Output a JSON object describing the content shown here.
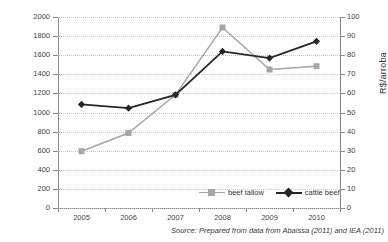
{
  "figure": {
    "title": "",
    "source_note": "Source: Prepared from data from Abaissa (2011) and IEA (2011)"
  },
  "legend": {
    "items": [
      {
        "label": "beef tallow",
        "color": "#a6a6a6",
        "marker": "square"
      },
      {
        "label": "cattle beef",
        "color": "#262626",
        "marker": "diamond"
      }
    ]
  },
  "chart_data": {
    "type": "line",
    "title": "",
    "xlabel": "",
    "ylabel": "R$/tone",
    "y2label": "R$/arroba",
    "categories": [
      "2005",
      "2006",
      "2007",
      "2008",
      "2009",
      "2010"
    ],
    "x": [
      2005,
      2006,
      2007,
      2008,
      2009,
      2010
    ],
    "ylim": [
      0,
      2000
    ],
    "y2lim": [
      0,
      100
    ],
    "yticks": [
      0,
      200,
      400,
      600,
      800,
      1000,
      1200,
      1400,
      1600,
      1800,
      2000
    ],
    "y2ticks": [
      0,
      10,
      20,
      30,
      40,
      50,
      60,
      70,
      80,
      90,
      100
    ],
    "grid": true,
    "legend_position": "bottom-right-inside",
    "series": [
      {
        "name": "beef tallow",
        "axis": "left",
        "unit": "R$/tone",
        "color": "#a6a6a6",
        "marker": "square",
        "values": [
          595,
          785,
          1185,
          1890,
          1450,
          1485
        ]
      },
      {
        "name": "cattle beef",
        "axis": "right",
        "unit": "R$/arroba",
        "color": "#262626",
        "marker": "diamond",
        "values": [
          54,
          52,
          59,
          82,
          78,
          87
        ],
        "values_left_scale": [
          1085,
          1045,
          1185,
          1640,
          1570,
          1745
        ]
      }
    ]
  }
}
